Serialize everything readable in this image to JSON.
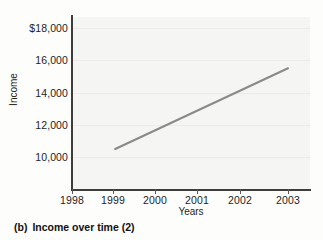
{
  "caption": {
    "label": "(b)",
    "text": "Income over time (2)"
  },
  "chart_data": {
    "type": "line",
    "title": "",
    "xlabel": "Years",
    "ylabel": "Income",
    "grid": "horizontal",
    "legend": "none",
    "xlim": [
      1998,
      2003.6
    ],
    "ylim": [
      9200,
      18800
    ],
    "xticks": [
      1998,
      1999,
      2000,
      2001,
      2002,
      2003
    ],
    "xtick_labels": [
      "1998",
      "1999",
      "2000",
      "2001",
      "2002",
      "2003"
    ],
    "yticks": [
      10000,
      12000,
      14000,
      16000,
      18000
    ],
    "ytick_labels": [
      "10,000",
      "12,000",
      "14,000",
      "16,000",
      "$18,000"
    ],
    "series": [
      {
        "name": "Income",
        "color": "#8a8a8a",
        "x": [
          1999,
          2003
        ],
        "values": [
          10500,
          15500
        ]
      }
    ]
  }
}
